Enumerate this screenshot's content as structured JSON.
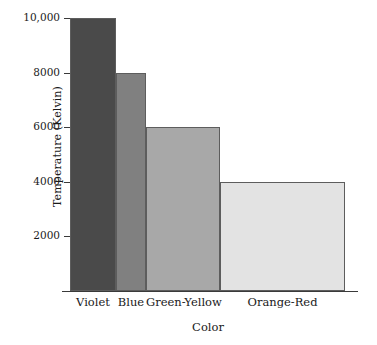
{
  "chart_data": {
    "type": "bar",
    "title": "",
    "xlabel": "Color",
    "ylabel": "Temperature (Kelvin)",
    "categories": [
      "Violet",
      "Blue",
      "Green-Yellow",
      "Orange-Red"
    ],
    "values": [
      10000,
      8000,
      6000,
      4000
    ],
    "ylim": [
      0,
      10000
    ],
    "yticks": [
      2000,
      4000,
      6000,
      8000,
      10000
    ],
    "ytick_labels": [
      "2000",
      "4000",
      "6000",
      "8000",
      "10,000"
    ],
    "grid": false,
    "legend": null,
    "bar_widths": [
      46,
      30,
      74,
      125
    ],
    "bar_colors": [
      "#4a4a4a",
      "#808080",
      "#a8a8a8",
      "#e3e3e3"
    ],
    "bar_edge_color": "#5d5d5d",
    "axis_color": "#3a3a3a",
    "background": "#ffffff",
    "series": [
      {
        "name": "Temperature",
        "points": [
          {
            "category": "Violet",
            "value": 10000
          },
          {
            "category": "Blue",
            "value": 8000
          },
          {
            "category": "Green-Yellow",
            "value": 6000
          },
          {
            "category": "Orange-Red",
            "value": 4000
          }
        ]
      }
    ]
  }
}
